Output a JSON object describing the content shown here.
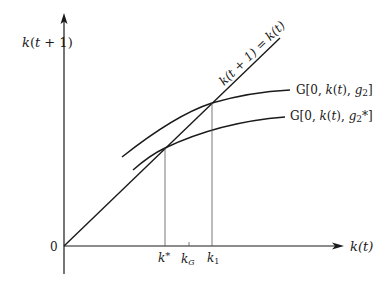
{
  "diagram": {
    "type": "phase-diagram",
    "y_axis_label": "k(t + 1)",
    "x_axis_label": "k(t)",
    "origin_label": "0",
    "diagonal_label": "k(t + 1) = k(t)",
    "curves": [
      {
        "name": "upper",
        "label": "G[0, k(t), g₂]"
      },
      {
        "name": "lower",
        "label": "G[0, k(t), g₂*]"
      }
    ],
    "x_ticks": [
      {
        "name": "k-star",
        "label": "k*"
      },
      {
        "name": "k-G",
        "label": "k_G",
        "main": "k",
        "sub": "G"
      },
      {
        "name": "k-1",
        "label": "k₁",
        "main": "k",
        "sub": "1"
      }
    ],
    "colors": {
      "ink": "#1a1a1a",
      "guide": "#555555",
      "background": "#ffffff"
    }
  }
}
